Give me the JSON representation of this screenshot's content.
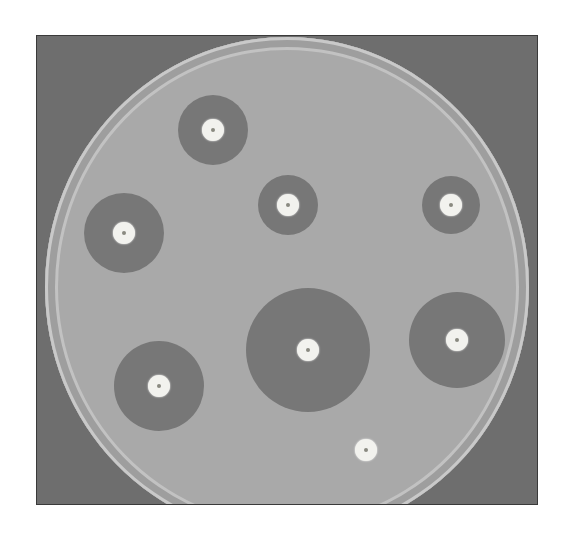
{
  "image": {
    "description": "Petri dish showing antibiotic disk diffusion test with zones of inhibition",
    "colors": {
      "background": "#ffffff",
      "frame": "#6e6e6e",
      "agar": "#a9a9a9",
      "inhibition_zone": "#777777",
      "disk": "#f2f2ee"
    },
    "disks": [
      {
        "label": "disk-1",
        "cx": 213,
        "cy": 130,
        "disk_r": 11,
        "zone_r": 35
      },
      {
        "label": "disk-2",
        "cx": 288,
        "cy": 205,
        "disk_r": 11,
        "zone_r": 30
      },
      {
        "label": "disk-3",
        "cx": 451,
        "cy": 205,
        "disk_r": 11,
        "zone_r": 29
      },
      {
        "label": "disk-4",
        "cx": 124,
        "cy": 233,
        "disk_r": 11,
        "zone_r": 40
      },
      {
        "label": "disk-5",
        "cx": 308,
        "cy": 350,
        "disk_r": 11,
        "zone_r": 62
      },
      {
        "label": "disk-6",
        "cx": 457,
        "cy": 340,
        "disk_r": 11,
        "zone_r": 48
      },
      {
        "label": "disk-7",
        "cx": 159,
        "cy": 386,
        "disk_r": 11,
        "zone_r": 45
      },
      {
        "label": "disk-8",
        "cx": 366,
        "cy": 450,
        "disk_r": 11,
        "zone_r": 0
      }
    ]
  }
}
